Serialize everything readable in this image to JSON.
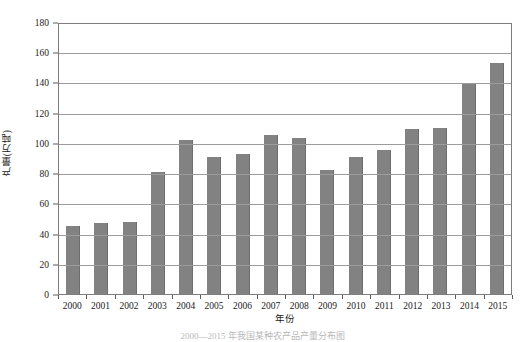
{
  "chart_data": {
    "type": "bar",
    "title": "",
    "xlabel": "年份",
    "ylabel": "产量(万吨)",
    "categories": [
      "2000",
      "2001",
      "2002",
      "2003",
      "2004",
      "2005",
      "2006",
      "2007",
      "2008",
      "2009",
      "2010",
      "2011",
      "2012",
      "2013",
      "2014",
      "2015"
    ],
    "values": [
      45,
      47,
      47.5,
      81,
      102,
      91,
      92.5,
      105.5,
      103.5,
      82,
      90.5,
      95,
      109.5,
      110,
      139,
      153
    ],
    "ylim": [
      0,
      180
    ],
    "yticks": [
      0,
      20,
      40,
      60,
      80,
      100,
      120,
      140,
      160,
      180
    ],
    "ytick_labels": [
      "0",
      "20",
      "40",
      "60",
      "80",
      "100",
      "120",
      "140",
      "160",
      "180"
    ],
    "grid": "horizontal",
    "legend": "none",
    "series": [
      {
        "name": "产量",
        "color": "#828282",
        "values": [
          45,
          47,
          47.5,
          81,
          102,
          91,
          92.5,
          105.5,
          103.5,
          82,
          90.5,
          95,
          109.5,
          110,
          139,
          153
        ]
      }
    ]
  },
  "caption": "2000—2015 年我国某种农产品产量分布图",
  "colors": {
    "bar": "#828282",
    "grid": "#9c9c9c",
    "axis": "#7d7d7d",
    "text": "#1a1a1a"
  }
}
